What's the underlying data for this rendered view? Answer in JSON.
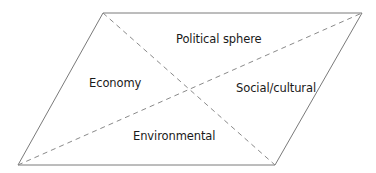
{
  "diagram": {
    "shape": "parallelogram",
    "stroke_color": "#7a7a7a",
    "dash_color": "#8a8a8a",
    "vertices": {
      "top_left": [
        103,
        13
      ],
      "top_right": [
        362,
        13
      ],
      "bottom_right": [
        275,
        165
      ],
      "bottom_left": [
        18,
        165
      ]
    },
    "diagonals_dashed": true,
    "regions": [
      {
        "id": "top",
        "label": "Political sphere"
      },
      {
        "id": "left",
        "label": "Economy"
      },
      {
        "id": "right",
        "label": "Social/cultural"
      },
      {
        "id": "bottom",
        "label": "Environmental"
      }
    ]
  }
}
